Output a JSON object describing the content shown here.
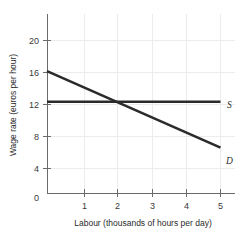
{
  "chart_data": {
    "type": "line",
    "title": "",
    "xlabel": "Labour (thousands of hours per day)",
    "ylabel": "Wage rate (euros per hour)",
    "xlim": [
      0,
      5.3
    ],
    "ylim": [
      0,
      22
    ],
    "xticks": [
      0,
      1,
      2,
      3,
      4,
      5
    ],
    "xtick_labels": [
      "0",
      "1",
      "2",
      "3",
      "4",
      "5"
    ],
    "yticks": [
      0,
      4,
      8,
      12,
      16,
      20
    ],
    "ytick_labels": [
      "0",
      "4",
      "8",
      "12",
      "16",
      "20"
    ],
    "grid": true,
    "legend_position": "right-inline",
    "series": [
      {
        "name": "S",
        "label": "S",
        "description": "Supply of labour (perfectly elastic)",
        "x": [
          0,
          5
        ],
        "values": [
          12,
          12
        ],
        "color": "#2b2b2b"
      },
      {
        "name": "D",
        "label": "D",
        "description": "Demand for labour",
        "x": [
          0,
          5
        ],
        "values": [
          16,
          6
        ],
        "color": "#2b2b2b"
      }
    ],
    "equilibrium": {
      "labour": 2,
      "wage": 12
    }
  },
  "axes": {
    "x_tick_0": "0",
    "x_tick_1": "1",
    "x_tick_2": "2",
    "x_tick_3": "3",
    "x_tick_4": "4",
    "x_tick_5": "5",
    "y_tick_0": "0",
    "y_tick_4": "4",
    "y_tick_8": "8",
    "y_tick_12": "12",
    "y_tick_16": "16",
    "y_tick_20": "20",
    "x_title": "Labour (thousands of hours per day)",
    "y_title": "Wage rate (euros per hour)"
  },
  "labels": {
    "supply": "S",
    "demand": "D"
  },
  "colors": {
    "line": "#2b2b2b",
    "axis": "#6b6b6b",
    "grid": "#ececec",
    "background": "#ffffff",
    "text": "#2b2b2b"
  }
}
